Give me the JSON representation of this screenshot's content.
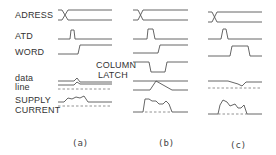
{
  "labels": {
    "address": "ADRESS",
    "atd": "ATD",
    "word": "WORD",
    "data_line_1": "data",
    "data_line_2": "line",
    "supply_1": "SUPPLY",
    "supply_2": "CURRENT",
    "column_latch_1": "COLUMN",
    "column_latch_2": "LATCH"
  },
  "captions": [
    "(a)",
    "(b)",
    "(c)"
  ],
  "colors": {
    "stroke": "#555555",
    "text": "#333333"
  }
}
